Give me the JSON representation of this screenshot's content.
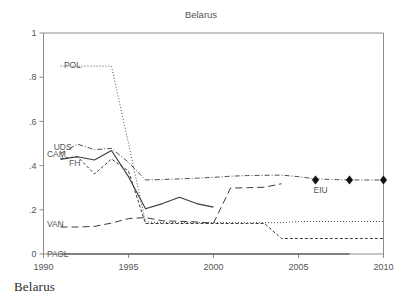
{
  "caption": "Belarus",
  "chart_data": {
    "type": "line",
    "title": "Belarus",
    "xlabel": "",
    "ylabel": "",
    "xlim": [
      1990,
      2010
    ],
    "ylim": [
      0,
      1
    ],
    "grid": false,
    "legend_position": "inline-labels",
    "xticks": [
      "1990",
      "1995",
      "2000",
      "2005",
      "2010"
    ],
    "xtick_values": [
      1990,
      1995,
      2000,
      2005,
      2010
    ],
    "yticks": [
      "0",
      ".2",
      ".4",
      ".6",
      ".8",
      "1"
    ],
    "ytick_values": [
      0,
      0.2,
      0.4,
      0.6,
      0.8,
      1
    ],
    "series": [
      {
        "name": "POL",
        "label": "POL",
        "style": "fine-dotted",
        "dash": "1,2",
        "width": 0.9,
        "color": "#6e6e6e",
        "label_x": 1991.2,
        "label_y": 0.855,
        "x": [
          1991,
          1992,
          1993,
          1994,
          1995,
          1996,
          1997,
          1998,
          1999,
          2000,
          2001,
          2002,
          2003,
          2004,
          2005,
          2006,
          2007,
          2008,
          2009,
          2010
        ],
        "y": [
          0.85,
          0.85,
          0.85,
          0.85,
          0.5,
          0.145,
          0.142,
          0.142,
          0.142,
          0.142,
          0.142,
          0.142,
          0.142,
          0.142,
          0.147,
          0.147,
          0.147,
          0.147,
          0.147,
          0.147
        ]
      },
      {
        "name": "UDS",
        "label": "UDS",
        "style": "dash-dot",
        "dash": "5,2,1,2",
        "width": 0.9,
        "color": "#4a4a4a",
        "label_x": 1990.6,
        "label_y": 0.485,
        "x": [
          1991,
          1992,
          1993,
          1994,
          1995,
          1996,
          1997,
          1998,
          1999,
          2000,
          2001,
          2002,
          2003,
          2004,
          2005,
          2006,
          2007,
          2008,
          2009,
          2010
        ],
        "y": [
          0.455,
          0.497,
          0.472,
          0.478,
          0.415,
          0.335,
          0.337,
          0.34,
          0.343,
          0.347,
          0.352,
          0.355,
          0.356,
          0.357,
          0.35,
          0.34,
          0.337,
          0.335,
          0.335,
          0.335
        ]
      },
      {
        "name": "CAM",
        "label": "CAM",
        "style": "solid",
        "dash": "none",
        "width": 1.1,
        "color": "#2f2f2f",
        "label_x": 1990.2,
        "label_y": 0.452,
        "x": [
          1991,
          1992,
          1993,
          1994,
          1995,
          1996,
          1997,
          1998,
          1999,
          2000
        ],
        "y": [
          0.428,
          0.44,
          0.425,
          0.468,
          0.35,
          0.205,
          0.228,
          0.257,
          0.228,
          0.212
        ]
      },
      {
        "name": "FH",
        "label": "FH",
        "style": "short-dash",
        "dash": "3,2",
        "width": 1.0,
        "color": "#3c3c3c",
        "label_x": 1991.5,
        "label_y": 0.412,
        "x": [
          1991,
          1992,
          1993,
          1994,
          1995,
          1996,
          1997,
          1998,
          1999,
          2000,
          2001,
          2002,
          2003,
          2004,
          2005,
          2006,
          2007,
          2008,
          2009,
          2010
        ],
        "y": [
          0.433,
          0.44,
          0.362,
          0.43,
          0.375,
          0.138,
          0.138,
          0.138,
          0.138,
          0.138,
          0.138,
          0.138,
          0.138,
          0.07,
          0.07,
          0.07,
          0.07,
          0.07,
          0.07,
          0.07
        ]
      },
      {
        "name": "VAN",
        "label": "VAN",
        "style": "long-dash",
        "dash": "7,4",
        "width": 1.0,
        "color": "#4a4a4a",
        "label_x": 1990.2,
        "label_y": 0.137,
        "x": [
          1991,
          1992,
          1993,
          1994,
          1995,
          1996,
          1997,
          1998,
          1999,
          2000,
          2001,
          2002,
          2003,
          2004
        ],
        "y": [
          0.122,
          0.122,
          0.125,
          0.14,
          0.16,
          0.165,
          0.15,
          0.148,
          0.145,
          0.14,
          0.298,
          0.3,
          0.302,
          0.318
        ]
      },
      {
        "name": "PACL",
        "label": "PACL",
        "style": "solid-light",
        "dash": "none",
        "width": 1.0,
        "color": "#9a9a9a",
        "label_x": 1990.2,
        "label_y": 0.0,
        "x": [
          1991,
          2008
        ],
        "y": [
          0.0,
          0.0
        ]
      }
    ],
    "markers": {
      "name": "EIU",
      "label": "EIU",
      "label_x": 2006.3,
      "label_y": 0.292,
      "marker": "diamond",
      "color": "#111111",
      "size": 4.2,
      "x": [
        2006,
        2008,
        2010
      ],
      "y": [
        0.335,
        0.335,
        0.335
      ]
    }
  }
}
